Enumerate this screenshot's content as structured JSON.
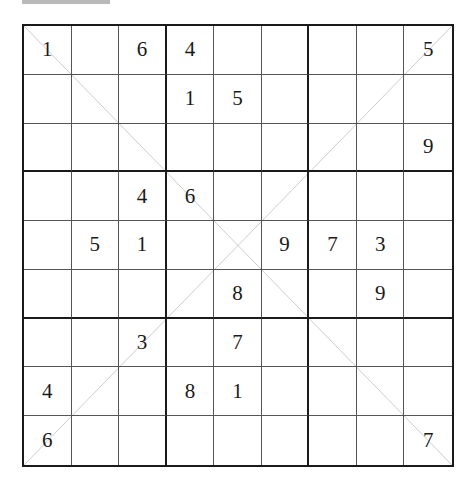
{
  "puzzle": {
    "type": "diagonal sudoku",
    "grid": [
      [
        "1",
        "",
        "6",
        "4",
        "",
        "",
        "",
        "",
        "5"
      ],
      [
        "",
        "",
        "",
        "1",
        "5",
        "",
        "",
        "",
        ""
      ],
      [
        "",
        "",
        "",
        "",
        "",
        "",
        "",
        "",
        "9"
      ],
      [
        "",
        "",
        "4",
        "6",
        "",
        "",
        "",
        "",
        ""
      ],
      [
        "",
        "5",
        "1",
        "",
        "",
        "9",
        "7",
        "3",
        ""
      ],
      [
        "",
        "",
        "",
        "",
        "8",
        "",
        "",
        "9",
        ""
      ],
      [
        "",
        "",
        "3",
        "",
        "7",
        "",
        "",
        "",
        ""
      ],
      [
        "4",
        "",
        "",
        "8",
        "1",
        "",
        "",
        "",
        ""
      ],
      [
        "6",
        "",
        "",
        "",
        "",
        "",
        "",
        "",
        "7"
      ]
    ]
  },
  "colors": {
    "ink": "#1a1a1a",
    "thin_line": "#555555",
    "top_bar": "#b9b9b9"
  }
}
